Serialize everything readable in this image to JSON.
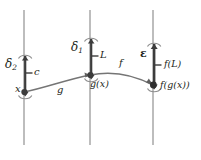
{
  "figure": {
    "colors": {
      "axis_line": "#9a9a9a",
      "curve": "#6e6e6e",
      "bracket": "#3a3a3a",
      "bracket_light": "#8c8c8c",
      "point": "#3a3a3a",
      "text": "#231f20"
    },
    "axes": [
      {
        "name": "domain-axis",
        "x": 24,
        "top": 10,
        "bottom": 145,
        "bracket_label": "δ",
        "bracket_sub": "2",
        "tick_label": "c",
        "point_label": "x"
      },
      {
        "name": "intermediate-axis",
        "x": 90,
        "top": 10,
        "bottom": 145,
        "bracket_label": "δ",
        "bracket_sub": "1",
        "tick_label": "L",
        "point_label": "g(x)"
      },
      {
        "name": "codomain-axis",
        "x": 153,
        "top": 10,
        "bottom": 145,
        "bracket_label": "ε",
        "bracket_sub": "",
        "tick_label": "f(L)",
        "point_label": "f(g(x))"
      }
    ],
    "maps": [
      {
        "name": "map-g",
        "label": "g",
        "from": "domain-axis",
        "to": "intermediate-axis"
      },
      {
        "name": "map-f",
        "label": "f",
        "from": "intermediate-axis",
        "to": "codomain-axis"
      }
    ],
    "labels": {
      "delta2": "δ",
      "delta2_sub": "2",
      "delta1": "δ",
      "delta1_sub": "1",
      "epsilon": "ε",
      "c": "c",
      "x": "x",
      "L": "L",
      "gx": "g(x)",
      "fL": "f(L)",
      "fgx": "f(g(x))",
      "g": "g",
      "f": "f"
    }
  }
}
